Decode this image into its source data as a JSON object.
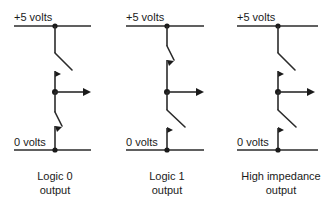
{
  "figure": {
    "background_color": "#ffffff",
    "line_color": "#2b2b2b",
    "width": 331,
    "height": 206
  },
  "circuits": [
    {
      "id": "circuit-logic-0",
      "supply_label": "+5 volts",
      "ground_label": "0 volts",
      "caption_line1": "Logic 0",
      "caption_line2": "output",
      "upper_switch_state": "open",
      "lower_switch_state": "closed",
      "output_arrow": "right"
    },
    {
      "id": "circuit-logic-1",
      "supply_label": "+5 volts",
      "ground_label": "0 volts",
      "caption_line1": "Logic 1",
      "caption_line2": "output",
      "upper_switch_state": "closed",
      "lower_switch_state": "open",
      "output_arrow": "right"
    },
    {
      "id": "circuit-high-impedance",
      "supply_label": "+5 volts",
      "ground_label": "0 volts",
      "caption_line1": "High impedance",
      "caption_line2": "output",
      "upper_switch_state": "open",
      "lower_switch_state": "open",
      "output_arrow": "right"
    }
  ]
}
